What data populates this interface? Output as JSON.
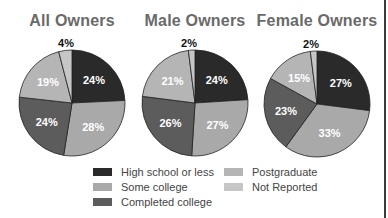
{
  "chart_data": [
    {
      "type": "pie",
      "title": "All Owners",
      "categories": [
        "High school or less",
        "Some college",
        "Completed college",
        "Postgraduate",
        "Not Reported"
      ],
      "values": [
        24,
        28,
        24,
        19,
        4
      ],
      "labels": [
        "24%",
        "28%",
        "24%",
        "19%",
        "4%"
      ]
    },
    {
      "type": "pie",
      "title": "Male Owners",
      "categories": [
        "High school or less",
        "Some college",
        "Completed college",
        "Postgraduate",
        "Not Reported"
      ],
      "values": [
        24,
        27,
        26,
        21,
        2
      ],
      "labels": [
        "24%",
        "27%",
        "26%",
        "21%",
        "2%"
      ]
    },
    {
      "type": "pie",
      "title": "Female Owners",
      "categories": [
        "High school or less",
        "Some college",
        "Completed college",
        "Postgraduate",
        "Not Reported"
      ],
      "values": [
        27,
        33,
        23,
        15,
        2
      ],
      "labels": [
        "27%",
        "33%",
        "23%",
        "15%",
        "2%"
      ]
    }
  ],
  "legend": {
    "position": "bottom",
    "items": [
      {
        "label": "High school or less",
        "color": "#2a2a2a"
      },
      {
        "label": "Some college",
        "color": "#a9a9a9"
      },
      {
        "label": "Completed college",
        "color": "#5c5c5c"
      },
      {
        "label": "Postgraduate",
        "color": "#b5b5b5"
      },
      {
        "label": "Not Reported",
        "color": "#c6c6c6"
      }
    ]
  },
  "slice_colors": [
    "#2a2a2a",
    "#a9a9a9",
    "#5c5c5c",
    "#b5b5b5",
    "#c6c6c6"
  ],
  "label_colors": [
    "#ffffff",
    "#ffffff",
    "#ffffff",
    "#ffffff",
    "#111111"
  ]
}
